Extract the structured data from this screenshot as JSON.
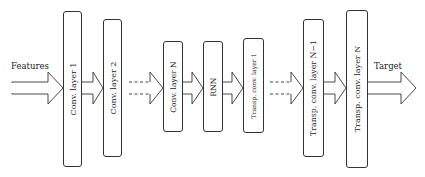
{
  "diagram": {
    "input_label": "Features",
    "output_label": "Target",
    "layers": [
      {
        "id": "conv1",
        "label": "Conv. layer 1",
        "x": 63,
        "y": 11,
        "w": 18,
        "h": 156
      },
      {
        "id": "conv2",
        "label": "Conv. layer 2",
        "x": 103,
        "y": 19,
        "w": 18,
        "h": 138
      },
      {
        "id": "convN",
        "label": "Conv. layer N",
        "x": 163,
        "y": 41,
        "w": 19,
        "h": 91
      },
      {
        "id": "rnn",
        "label": "RNN",
        "x": 203,
        "y": 41,
        "w": 19,
        "h": 91
      },
      {
        "id": "tconv1",
        "label": "Transp. conv. layer 1",
        "x": 243,
        "y": 38,
        "w": 20,
        "h": 95
      },
      {
        "id": "tconvN1",
        "label": "Transp. conv. layer N−1",
        "x": 303,
        "y": 19,
        "w": 20,
        "h": 138
      },
      {
        "id": "tconvN",
        "label": "Transp. conv. layer N",
        "x": 346,
        "y": 10,
        "w": 21,
        "h": 158
      }
    ],
    "connections": [
      {
        "from": "input",
        "to": "conv1",
        "style": "solid"
      },
      {
        "from": "conv1",
        "to": "conv2",
        "style": "solid"
      },
      {
        "from": "conv2",
        "to": "convN",
        "style": "dashed"
      },
      {
        "from": "convN",
        "to": "rnn",
        "style": "solid"
      },
      {
        "from": "rnn",
        "to": "tconv1",
        "style": "solid"
      },
      {
        "from": "tconv1",
        "to": "tconvN1",
        "style": "dashed"
      },
      {
        "from": "tconvN1",
        "to": "tconvN",
        "style": "solid"
      },
      {
        "from": "tconvN",
        "to": "output",
        "style": "solid"
      }
    ],
    "colors": {
      "stroke": "#333333",
      "fill": "#ffffff",
      "text": "#222222"
    }
  }
}
